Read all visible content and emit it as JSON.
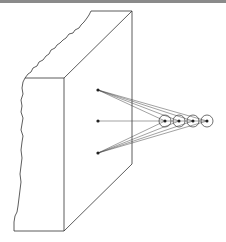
{
  "diagram": {
    "colors": {
      "line": "#333333",
      "border": "#8a8a8a",
      "background": "#ffffff"
    },
    "slab": {
      "front_face": [
        [
          25,
          78
        ],
        [
          64,
          78
        ],
        [
          64,
          231
        ],
        [
          14,
          231
        ]
      ],
      "top_face": [
        [
          25,
          78
        ],
        [
          91,
          11
        ],
        [
          132,
          11
        ],
        [
          64,
          78
        ]
      ],
      "side_face": [
        [
          64,
          78
        ],
        [
          132,
          11
        ],
        [
          132,
          164
        ],
        [
          64,
          231
        ]
      ]
    },
    "source_points": [
      {
        "id": "top",
        "x": 98,
        "y": 90
      },
      {
        "id": "middle",
        "x": 98,
        "y": 121
      },
      {
        "id": "bottom",
        "x": 98,
        "y": 153
      }
    ],
    "target_circles": [
      {
        "x": 165,
        "y": 121,
        "r": 6
      },
      {
        "x": 179,
        "y": 121,
        "r": 6
      },
      {
        "x": 193,
        "y": 121,
        "r": 6
      },
      {
        "x": 207,
        "y": 121,
        "r": 6
      }
    ]
  }
}
